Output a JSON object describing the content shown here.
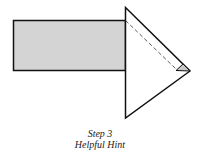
{
  "diagram": {
    "caption": {
      "line1": "Step 3",
      "line2": "Helpful Hint"
    },
    "shapes": {
      "rectangle": {
        "fill": "#d4d4d4",
        "stroke": "#111111"
      },
      "triangle": {
        "fill": "#ffffff",
        "stroke": "#111111"
      },
      "fold_flap": {
        "fill": "#c8c8c8",
        "stroke": "#111111"
      },
      "fold_line": {
        "style": "dashed",
        "stroke": "#333333"
      }
    }
  }
}
